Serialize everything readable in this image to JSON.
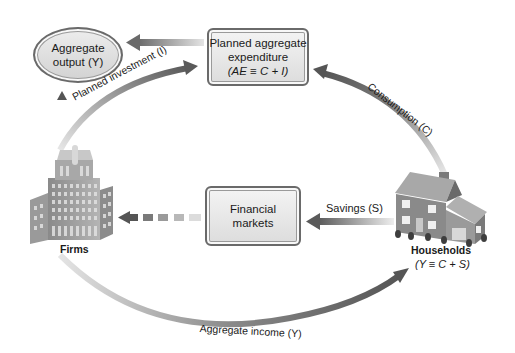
{
  "nodes": {
    "aggregate_output": {
      "line1": "Aggregate",
      "line2": "output (Y)"
    },
    "planned_expenditure": {
      "line1": "Planned aggregate",
      "line2": "expenditure",
      "line3": "(AE ≡ C + I)"
    },
    "financial_markets": {
      "line1": "Financial",
      "line2": "markets"
    },
    "firms": {
      "label": "Firms",
      "icon": "office-building-icon"
    },
    "households": {
      "label": "Households",
      "identity": "(Y ≡ C + S)",
      "icon": "house-icon"
    }
  },
  "flows": {
    "planned_investment": "Planned investment (I)",
    "consumption": "Consumption (C)",
    "savings": "Savings (S)",
    "aggregate_income": "Aggregate income (Y)"
  },
  "colors": {
    "arrow_dark": "#5a5a5a",
    "arrow_light": "#d8d8d8",
    "box_border": "#6a6a6a",
    "box_fill": "#e4e4e4"
  }
}
